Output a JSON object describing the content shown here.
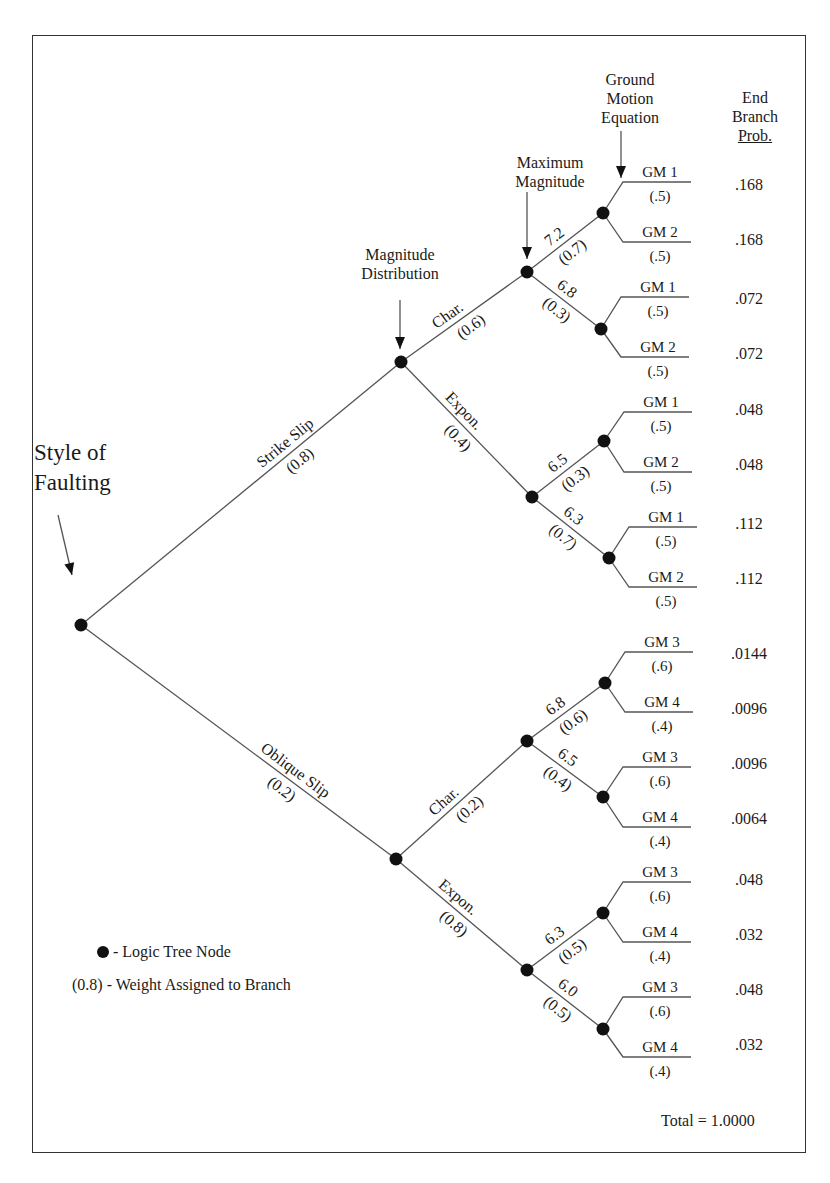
{
  "headers": {
    "style_of_faulting": [
      "Style of",
      "Faulting"
    ],
    "magnitude_distribution": [
      "Magnitude",
      "Distribution"
    ],
    "maximum_magnitude": [
      "Maximum",
      "Magnitude"
    ],
    "ground_motion_equation": [
      "Ground",
      "Motion",
      "Equation"
    ],
    "end_branch_prob": [
      "End",
      "Branch",
      "Prob."
    ]
  },
  "tree": {
    "root": {
      "branches": [
        {
          "label": "Strike Slip",
          "weight": "(0.8)",
          "children": [
            {
              "label": "Char.",
              "weight": "(0.6)",
              "children": [
                {
                  "label": "7.2",
                  "weight": "(0.7)",
                  "leaves": [
                    {
                      "label": "GM 1",
                      "weight": "(.5)",
                      "prob": ".168"
                    },
                    {
                      "label": "GM 2",
                      "weight": "(.5)",
                      "prob": ".168"
                    }
                  ]
                },
                {
                  "label": "6.8",
                  "weight": "(0.3)",
                  "leaves": [
                    {
                      "label": "GM 1",
                      "weight": "(.5)",
                      "prob": ".072"
                    },
                    {
                      "label": "GM 2",
                      "weight": "(.5)",
                      "prob": ".072"
                    }
                  ]
                }
              ]
            },
            {
              "label": "Expon.",
              "weight": "(0.4)",
              "children": [
                {
                  "label": "6.5",
                  "weight": "(0.3)",
                  "leaves": [
                    {
                      "label": "GM 1",
                      "weight": "(.5)",
                      "prob": ".048"
                    },
                    {
                      "label": "GM 2",
                      "weight": "(.5)",
                      "prob": ".048"
                    }
                  ]
                },
                {
                  "label": "6.3",
                  "weight": "(0.7)",
                  "leaves": [
                    {
                      "label": "GM 1",
                      "weight": "(.5)",
                      "prob": ".112"
                    },
                    {
                      "label": "GM 2",
                      "weight": "(.5)",
                      "prob": ".112"
                    }
                  ]
                }
              ]
            }
          ]
        },
        {
          "label": "Oblique Slip",
          "weight": "(0.2)",
          "children": [
            {
              "label": "Char.",
              "weight": "(0.2)",
              "children": [
                {
                  "label": "6.8",
                  "weight": "(0.6)",
                  "leaves": [
                    {
                      "label": "GM 3",
                      "weight": "(.6)",
                      "prob": ".0144"
                    },
                    {
                      "label": "GM 4",
                      "weight": "(.4)",
                      "prob": ".0096"
                    }
                  ]
                },
                {
                  "label": "6.5",
                  "weight": "(0.4)",
                  "leaves": [
                    {
                      "label": "GM 3",
                      "weight": "(.6)",
                      "prob": ".0096"
                    },
                    {
                      "label": "GM 4",
                      "weight": "(.4)",
                      "prob": ".0064"
                    }
                  ]
                }
              ]
            },
            {
              "label": "Expon.",
              "weight": "(0.8)",
              "children": [
                {
                  "label": "6.3",
                  "weight": "(0.5)",
                  "leaves": [
                    {
                      "label": "GM 3",
                      "weight": "(.6)",
                      "prob": ".048"
                    },
                    {
                      "label": "GM 4",
                      "weight": "(.4)",
                      "prob": ".032"
                    }
                  ]
                },
                {
                  "label": "6.0",
                  "weight": "(0.5)",
                  "leaves": [
                    {
                      "label": "GM 3",
                      "weight": "(.6)",
                      "prob": ".048"
                    },
                    {
                      "label": "GM 4",
                      "weight": "(.4)",
                      "prob": ".032"
                    }
                  ]
                }
              ]
            }
          ]
        }
      ]
    }
  },
  "legend": {
    "node": "- Logic Tree Node",
    "weight": "(0.8) - Weight Assigned to Branch"
  },
  "total": "Total = 1.0000",
  "colors": {
    "line": "#555555",
    "node": "#111111",
    "text": "#1a1a1a",
    "border": "#333333"
  }
}
